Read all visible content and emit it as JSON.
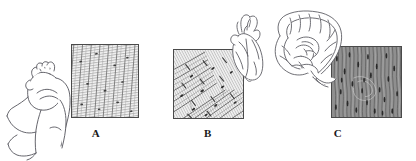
{
  "figure": {
    "background_color": "#ffffff",
    "width": 416,
    "height": 161
  },
  "panels": [
    {
      "letter": "A",
      "tissue_name": "skeletal muscle",
      "organ_icon": "flexed-arm-icon",
      "micrograph_icon": "skeletal-muscle-micrograph-icon",
      "texture": "long parallel striated fibers with cross-banding",
      "fiber_color": "#9a9a9a",
      "background_color": "#f2f2f2",
      "border_color": "#4a4a4a"
    },
    {
      "letter": "B",
      "tissue_name": "cardiac muscle",
      "organ_icon": "heart-icon",
      "micrograph_icon": "cardiac-muscle-micrograph-icon",
      "texture": "branching diagonal fibers with intercalated discs and dark nuclei",
      "fiber_color": "#a0a0a0",
      "background_color": "#f0f0f0",
      "border_color": "#4a4a4a"
    },
    {
      "letter": "C",
      "tissue_name": "smooth muscle",
      "organ_icon": "intestine-icon",
      "micrograph_icon": "smooth-muscle-micrograph-icon",
      "texture": "dense spindle-shaped cells with central nuclei",
      "fiber_color": "#4b4b4b",
      "background_color": "#8e8e8e",
      "border_color": "#3a3a3a"
    }
  ],
  "line_art": {
    "stroke_color": "#55555c",
    "fill_color": "#ffffff"
  }
}
